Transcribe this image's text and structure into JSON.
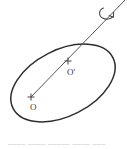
{
  "figure": {
    "type": "geometric-diagram",
    "background_color": "#ffffff",
    "stroke_color": "#2e2e2e",
    "label_color": "#3a3a3a",
    "faint_text_color": "#b9b9b9",
    "width": 127,
    "height": 149
  },
  "labels": {
    "origin": "O",
    "origin_prime": "O'"
  },
  "elements": {
    "ellipse_name": "tilted-ellipse",
    "axis_name": "rotation-axis-line",
    "arrow_name": "rotation-direction-arrow",
    "marker_o_name": "point-marker-o",
    "marker_oprime_name": "point-marker-o-prime"
  },
  "caption": {
    "text": "____  ____   _____   ____  ___"
  },
  "geometry": {
    "ellipse_center_x": 63,
    "ellipse_center_y": 83,
    "ellipse_rx": 57,
    "ellipse_ry": 33,
    "ellipse_rotation_deg": -27,
    "axis_start_x": 31,
    "axis_start_y": 97,
    "axis_end_x": 127,
    "axis_end_y": 0,
    "point_o_x": 31,
    "point_o_y": 97,
    "point_o_prime_x": 68,
    "point_o_prime_y": 61
  }
}
